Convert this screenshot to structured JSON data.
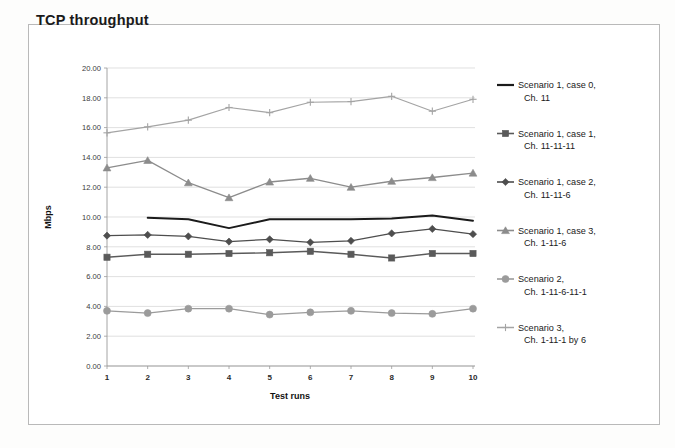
{
  "chart_data": {
    "type": "line",
    "title": "TCP throughput",
    "xlabel": "Test runs",
    "ylabel": "Mbps",
    "x": [
      1,
      2,
      3,
      4,
      5,
      6,
      7,
      8,
      9,
      10
    ],
    "xtick_labels": [
      "1",
      "2",
      "3",
      "4",
      "5",
      "6",
      "7",
      "8",
      "9",
      "10"
    ],
    "ytick_labels": [
      "0.00",
      "2.00",
      "4.00",
      "6.00",
      "8.00",
      "10.00",
      "12.00",
      "14.00",
      "16.00",
      "18.00",
      "20.00"
    ],
    "ytick_values": [
      0,
      2,
      4,
      6,
      8,
      10,
      12,
      14,
      16,
      18,
      20
    ],
    "ylim": [
      0,
      20
    ],
    "xlim": [
      1,
      10
    ],
    "grid": true,
    "legend_position": "right",
    "series": [
      {
        "name": "Scenario 1, case 0, Ch. 11",
        "label_line1": "Scenario 1, case 0,",
        "label_line2": "Ch. 11",
        "color": "#1b1b1b",
        "marker": "none",
        "width": 1.9,
        "x": [
          2,
          3,
          4,
          5,
          6,
          7,
          8,
          9,
          10
        ],
        "values": [
          9.95,
          9.85,
          9.25,
          9.85,
          9.85,
          9.85,
          9.9,
          10.1,
          9.75
        ]
      },
      {
        "name": "Scenario 1, case 1, Ch. 11-11-11",
        "label_line1": "Scenario 1,  case 1,",
        "label_line2": "Ch. 11-11-11",
        "color": "#5a5a5a",
        "marker": "square",
        "width": 1.3,
        "x": [
          1,
          2,
          3,
          4,
          5,
          6,
          7,
          8,
          9,
          10
        ],
        "values": [
          7.3,
          7.5,
          7.5,
          7.55,
          7.6,
          7.7,
          7.5,
          7.25,
          7.55,
          7.55
        ]
      },
      {
        "name": "Scenario 1, case 2, Ch. 11-11-6",
        "label_line1": "Scenario 1, case 2,",
        "label_line2": "Ch. 11-11-6",
        "color": "#4e4e4e",
        "marker": "diamond",
        "width": 1.3,
        "x": [
          1,
          2,
          3,
          4,
          5,
          6,
          7,
          8,
          9,
          10
        ],
        "values": [
          8.75,
          8.8,
          8.7,
          8.35,
          8.5,
          8.3,
          8.4,
          8.9,
          9.2,
          8.85
        ]
      },
      {
        "name": "Scenario 1, case 3, Ch. 1-11-6",
        "label_line1": "Scenario 1, case 3,",
        "label_line2": "Ch. 1-11-6",
        "color": "#8c8c8c",
        "marker": "triangle",
        "width": 1.3,
        "x": [
          1,
          2,
          3,
          4,
          5,
          6,
          7,
          8,
          9,
          10
        ],
        "values": [
          13.3,
          13.8,
          12.3,
          11.3,
          12.35,
          12.6,
          12.0,
          12.4,
          12.65,
          12.95
        ]
      },
      {
        "name": "Scenario 2, Ch. 1-11-6-11-1",
        "label_line1": "Scenario 2,",
        "label_line2": "Ch. 1-11-6-11-1",
        "color": "#9b9b9b",
        "marker": "circle",
        "width": 1.3,
        "x": [
          1,
          2,
          3,
          4,
          5,
          6,
          7,
          8,
          9,
          10
        ],
        "values": [
          3.7,
          3.55,
          3.85,
          3.85,
          3.45,
          3.6,
          3.7,
          3.55,
          3.5,
          3.85
        ]
      },
      {
        "name": "Scenario 3, Ch. 1-11-1 by 6",
        "label_line1": "Scenario 3,",
        "label_line2": "Ch. 1-11-1 by 6",
        "color": "#a4a4a4",
        "marker": "plus",
        "width": 1.2,
        "x": [
          1,
          2,
          3,
          4,
          5,
          6,
          7,
          8,
          9,
          10
        ],
        "values": [
          15.65,
          16.05,
          16.5,
          17.35,
          17.0,
          17.7,
          17.75,
          18.1,
          17.1,
          17.9
        ]
      }
    ]
  },
  "legend": {
    "entries": [
      {
        "line1": "Scenario 1, case 0,",
        "line2": "Ch. 11"
      },
      {
        "line1": "Scenario 1,  case 1,",
        "line2": "Ch. 11-11-11"
      },
      {
        "line1": "Scenario 1, case 2,",
        "line2": "Ch. 11-11-6"
      },
      {
        "line1": "Scenario 1, case 3,",
        "line2": "Ch. 1-11-6"
      },
      {
        "line1": "Scenario 2,",
        "line2": "Ch. 1-11-6-11-1"
      },
      {
        "line1": "Scenario 3,",
        "line2": "Ch. 1-11-1 by 6"
      }
    ]
  }
}
